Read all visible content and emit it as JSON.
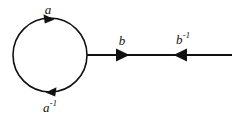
{
  "figure": {
    "background_color": "#ffffff",
    "stroke_color": "#111111",
    "width": 242,
    "height": 118,
    "loop": {
      "center_x": 50,
      "center_y": 55,
      "radius": 37,
      "stroke_width": 1.6,
      "top_label": "a",
      "bottom_label_base": "a",
      "bottom_label_sup": "-1",
      "top_arrow_direction": "right",
      "bottom_arrow_direction": "left"
    },
    "edge": {
      "start_x": 87,
      "end_x": 232,
      "y": 55,
      "stroke_width": 2.2,
      "left_label_base": "b",
      "left_label_sup": "",
      "right_label_base": "b",
      "right_label_sup": "-1",
      "left_arrow_direction": "right",
      "left_arrow_x": 123,
      "right_arrow_direction": "left",
      "right_arrow_x": 180
    }
  }
}
